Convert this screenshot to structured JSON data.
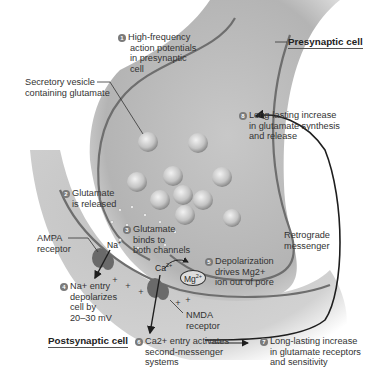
{
  "figure": {
    "cells": {
      "presynaptic": "Presynaptic cell",
      "postsynaptic": "Postsynaptic cell"
    },
    "labels": {
      "vesicle": [
        "Secretory vesicle",
        "containing glutamate"
      ],
      "ampa": [
        "AMPA",
        "receptor"
      ],
      "nmda": [
        "NMDA",
        "receptor"
      ],
      "retrograde": [
        "Retrograde",
        "messenger"
      ]
    },
    "ions": {
      "na": "Na",
      "na_charge": "+",
      "ca": "Ca",
      "ca_charge": "2+",
      "mg": "Mg",
      "mg_charge": "2+"
    },
    "steps": [
      {
        "num": "1",
        "lines": [
          "High-frequency",
          "action potentials",
          "in presynaptic",
          "cell"
        ]
      },
      {
        "num": "2",
        "lines": [
          "Glutamate",
          "is released"
        ]
      },
      {
        "num": "3",
        "lines": [
          "Glutamate",
          "binds to",
          "both channels"
        ]
      },
      {
        "num": "4",
        "lines": [
          "Na+ entry",
          "depolarizes",
          "cell by",
          "20–30 mV"
        ]
      },
      {
        "num": "5",
        "lines": [
          "Depolarization",
          "drives Mg2+",
          "ion out of pore"
        ]
      },
      {
        "num": "6",
        "lines": [
          "Ca2+ entry activates",
          "second-messenger",
          "systems"
        ]
      },
      {
        "num": "7",
        "lines": [
          "Long-lasting increase",
          "in glutamate receptors",
          "and sensitivity"
        ]
      },
      {
        "num": "8",
        "lines": [
          "Long-lasting increase",
          "in glutamate synthesis",
          "and release"
        ]
      }
    ],
    "colors": {
      "membrane": "#6e6e6e",
      "cytoplasm": "#bdbdbd",
      "vesicle": "#cfcfcf",
      "step_badge": "#7a7a7a",
      "arrow": "#1e1e1e"
    }
  }
}
